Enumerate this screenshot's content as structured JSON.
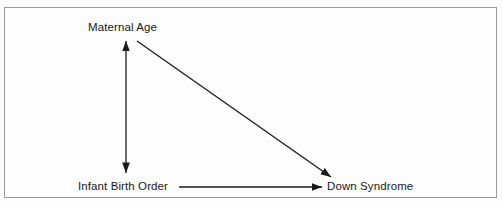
{
  "figure": {
    "type": "causal-path-diagram",
    "background_color": "#fdfdfd",
    "border_color": "#9a9a9a",
    "line_color": "#1a1a1a",
    "text_color": "#1a1a1a"
  },
  "nodes": [
    {
      "id": "maternal-age",
      "label": "Maternal Age",
      "x": 126,
      "y": 28
    },
    {
      "id": "infant-birth-order",
      "label": "Infant Birth Order",
      "x": 126,
      "y": 187
    },
    {
      "id": "down-syndrome",
      "label": "Down Syndrome",
      "x": 373,
      "y": 187
    }
  ],
  "edges": [
    {
      "id": "maternal-age-infant-birth-order",
      "from": "infant-birth-order",
      "to": "maternal-age",
      "arrowheads": "both",
      "orientation": "vertical"
    },
    {
      "id": "maternal-age-down-syndrome",
      "from": "maternal-age",
      "to": "down-syndrome",
      "arrowheads": "end",
      "orientation": "diagonal"
    },
    {
      "id": "infant-birth-order-down-syndrome",
      "from": "infant-birth-order",
      "to": "down-syndrome",
      "arrowheads": "end",
      "orientation": "horizontal"
    }
  ]
}
